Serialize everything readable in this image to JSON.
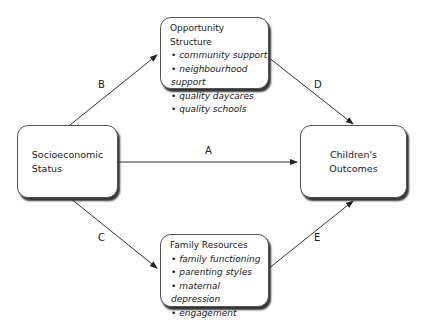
{
  "nodes": {
    "ses": {
      "label_line1": "Socioeconomic",
      "label_line2": "Status"
    },
    "outcomes": {
      "label_line1": "Children's",
      "label_line2": "Outcomes"
    },
    "opportunity": {
      "title": "Opportunity Structure",
      "items": [
        "community support",
        "neighbourhood support",
        "quality daycares",
        "quality schools"
      ]
    },
    "family": {
      "title": "Family Resources",
      "items": [
        "family functioning",
        "parenting styles",
        "maternal depression",
        "engagement"
      ]
    }
  },
  "edges": {
    "A": "A",
    "B": "B",
    "C": "C",
    "D": "D",
    "E": "E"
  }
}
